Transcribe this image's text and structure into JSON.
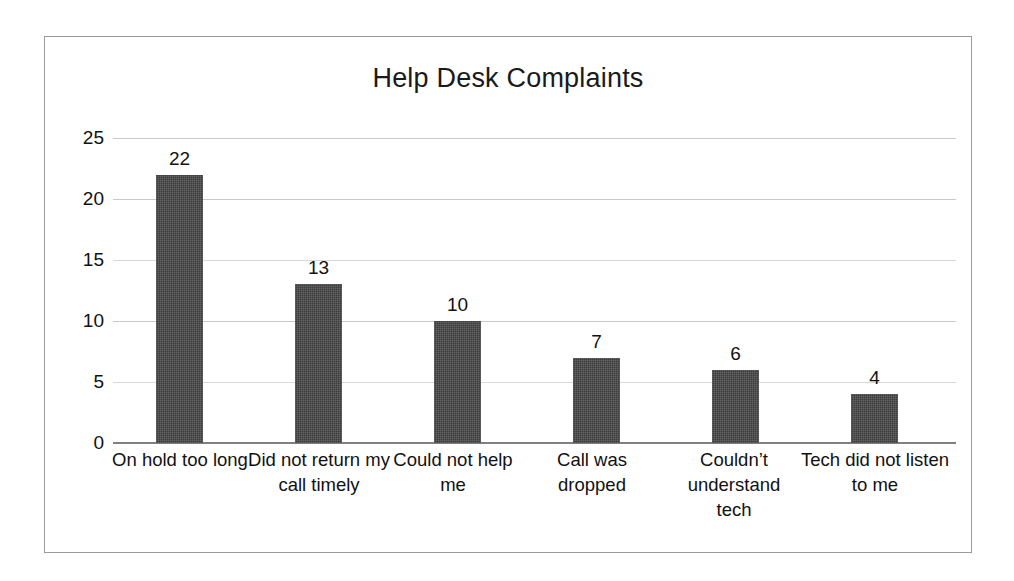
{
  "chart_data": {
    "type": "bar",
    "title": "Help Desk Complaints",
    "xlabel": "",
    "ylabel": "",
    "categories": [
      "On hold too long",
      "Did not return my call timely",
      "Could not help me",
      "Call was dropped",
      "Couldn’t understand tech",
      "Tech did not listen to me"
    ],
    "values": [
      22,
      13,
      10,
      7,
      6,
      4
    ],
    "value_labels": [
      "22",
      "13",
      "10",
      "7",
      "6",
      "4"
    ],
    "ylim": [
      0,
      25
    ],
    "yticks": [
      0,
      5,
      10,
      15,
      20,
      25
    ],
    "ytick_labels": [
      "0",
      "5",
      "10",
      "15",
      "20",
      "25"
    ],
    "grid": true,
    "legend": false,
    "bar_color": "#3c3c3c",
    "gridline_color": "#c9c9c9",
    "axis_color": "#808080",
    "frame_color": "#9a9a9a",
    "background": "#ffffff"
  }
}
